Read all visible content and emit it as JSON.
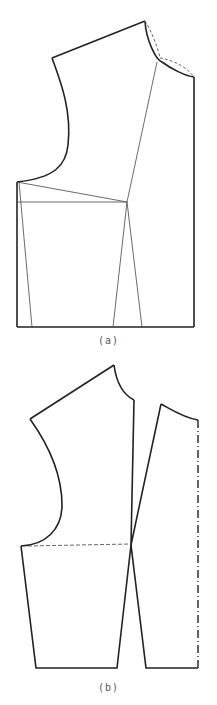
{
  "figure_a": {
    "caption": "(a)",
    "description": "Bodice pattern draft with shoulder/neckline (dashed adjustment), armhole curve, and dart lines to hem"
  },
  "figure_b": {
    "caption": "(b)",
    "description": "Bodice pattern split into side and center pieces, with dashed waistline and dash-dot center-front fold line"
  },
  "colors": {
    "line": "#222222",
    "thin_line": "#444444",
    "dashed": "#666666",
    "caption": "#555555"
  }
}
